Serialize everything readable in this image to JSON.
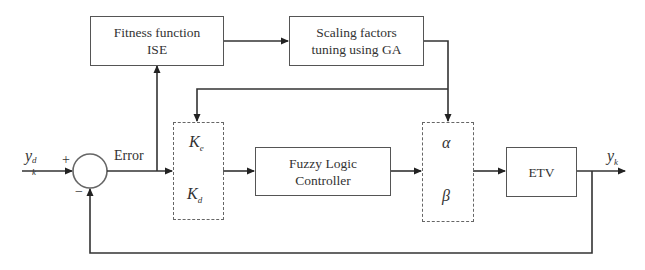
{
  "diagram": {
    "type": "block-diagram",
    "title": "",
    "blocks": {
      "fitness": {
        "line1": "Fitness function",
        "line2": "ISE"
      },
      "scaling": {
        "line1": "Scaling factors",
        "line2": "tuning using GA"
      },
      "input_gains": {
        "top": "K",
        "top_sub": "e",
        "bottom": "K",
        "bottom_sub": "d"
      },
      "controller": {
        "line1": "Fuzzy Logic",
        "line2": "Controller"
      },
      "output_gains": {
        "top": "α",
        "bottom": "β"
      },
      "plant": {
        "label": "ETV"
      }
    },
    "signals": {
      "reference": {
        "base": "y",
        "sub": "k",
        "sup": "d"
      },
      "plus_sign": "+",
      "minus_sign": "−",
      "error": "Error",
      "output": {
        "base": "y",
        "sub": "k"
      }
    },
    "connections": [
      {
        "from": "reference",
        "to": "summing-junction",
        "sign": "+"
      },
      {
        "from": "summing-junction",
        "to": "input_gains",
        "label": "Error"
      },
      {
        "from": "error",
        "to": "fitness"
      },
      {
        "from": "fitness",
        "to": "scaling"
      },
      {
        "from": "scaling",
        "to": "input_gains"
      },
      {
        "from": "scaling",
        "to": "output_gains"
      },
      {
        "from": "input_gains",
        "to": "controller"
      },
      {
        "from": "controller",
        "to": "output_gains"
      },
      {
        "from": "output_gains",
        "to": "plant"
      },
      {
        "from": "plant",
        "to": "output"
      },
      {
        "from": "output",
        "to": "summing-junction",
        "sign": "−"
      }
    ],
    "colors": {
      "line": "#333333",
      "box_border": "#555555",
      "text": "#333333",
      "background": "#ffffff"
    }
  }
}
